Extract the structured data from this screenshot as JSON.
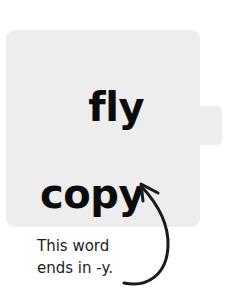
{
  "background_color": "#ffffff",
  "card": {
    "name": "word-card",
    "fill_color": "#ededed",
    "tab_label": "",
    "words": [
      {
        "text": "fly",
        "style": "bold"
      },
      {
        "text": "copy",
        "style": "bold"
      }
    ]
  },
  "annotation": {
    "lines": [
      "This word",
      "ends in -y."
    ],
    "text_color": "#1d1d1d",
    "arrow": {
      "name": "curved-arrow-icon",
      "color": "#1a1a1a",
      "points_to": "copy"
    }
  }
}
